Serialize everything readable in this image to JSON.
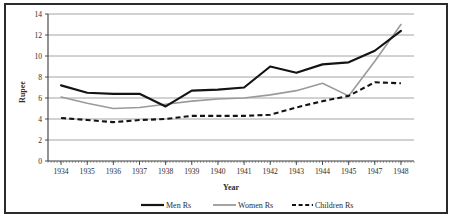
{
  "chart_data": {
    "type": "line",
    "title": "",
    "xlabel": "Year",
    "ylabel": "Rupee",
    "categories": [
      "1934",
      "1935",
      "1936",
      "1937",
      "1938",
      "1939",
      "1940",
      "1941",
      "1942",
      "1943",
      "1944",
      "1945",
      "1947",
      "1948"
    ],
    "ylim": [
      0,
      14
    ],
    "yticks": [
      "0",
      "2",
      "4",
      "6",
      "8",
      "10",
      "12",
      "14"
    ],
    "grid": "horizontal",
    "legend_position": "bottom",
    "series": [
      {
        "name": "Men Rs",
        "style": "solid-black",
        "color": "#141414",
        "values": [
          7.2,
          6.5,
          6.4,
          6.4,
          5.2,
          6.7,
          6.8,
          7.0,
          9.0,
          8.4,
          9.2,
          9.4,
          10.5,
          12.4
        ]
      },
      {
        "name": "Women Rs",
        "style": "solid-gray",
        "color": "#9a9a9a",
        "values": [
          6.1,
          5.5,
          5.0,
          5.1,
          5.4,
          5.7,
          5.9,
          6.0,
          6.3,
          6.7,
          7.4,
          6.2,
          9.5,
          13.0
        ]
      },
      {
        "name": "Children Rs",
        "style": "dashed-black",
        "color": "#141414",
        "values": [
          4.1,
          3.9,
          3.7,
          3.9,
          4.0,
          4.3,
          4.3,
          4.3,
          4.4,
          5.1,
          5.7,
          6.2,
          7.5,
          7.4
        ]
      }
    ]
  },
  "axes": {
    "y_title": "Rupee",
    "x_title": "Year"
  },
  "legend": {
    "items": [
      {
        "label": "Men Rs"
      },
      {
        "label": "Women Rs"
      },
      {
        "label": "Children Rs"
      }
    ]
  }
}
